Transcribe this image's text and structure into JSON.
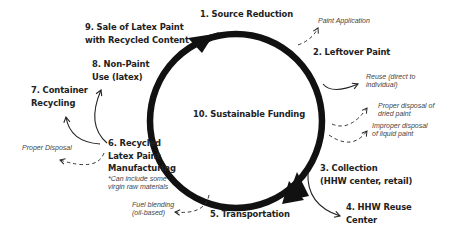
{
  "diagram": {
    "center_label": "10. Sustainable Funding",
    "stages": [
      {
        "id": "s1",
        "lines": [
          "1. Source Reduction"
        ]
      },
      {
        "id": "s2",
        "lines": [
          "2. Leftover Paint"
        ]
      },
      {
        "id": "s3",
        "lines": [
          "3. Collection",
          "(HHW center, retail)"
        ]
      },
      {
        "id": "s4",
        "lines": [
          "4. HHW Reuse",
          "Center"
        ]
      },
      {
        "id": "s5",
        "lines": [
          "5. Transportation"
        ]
      },
      {
        "id": "s6",
        "lines": [
          "6. Recycled",
          "Latex Paint",
          "Manufacturing"
        ]
      },
      {
        "id": "s7",
        "lines": [
          "7. Container",
          "Recycling"
        ]
      },
      {
        "id": "s8",
        "lines": [
          "8. Non-Paint",
          "Use (latex)"
        ]
      },
      {
        "id": "s9",
        "lines": [
          "9. Sale of Latex Paint",
          "with Recycled Content"
        ]
      }
    ],
    "notes": {
      "paint_application": [
        "Paint Application"
      ],
      "reuse": [
        "Reuse (direct to",
        "individual)"
      ],
      "proper_dried": [
        "Proper disposal of",
        "dried paint"
      ],
      "improper_liquid": [
        "Improper disposal",
        "of liquid paint"
      ],
      "manufacturing_footnote": [
        "*Can include some",
        "virgin raw materials"
      ],
      "proper_disposal": [
        "Proper Disposal"
      ],
      "fuel_blending": [
        "Fuel blending",
        "(oil-based)"
      ]
    },
    "colors": {
      "cycle_stroke": "#111111",
      "text": "#222222",
      "note_text": "#444444",
      "background": "#ffffff"
    }
  }
}
